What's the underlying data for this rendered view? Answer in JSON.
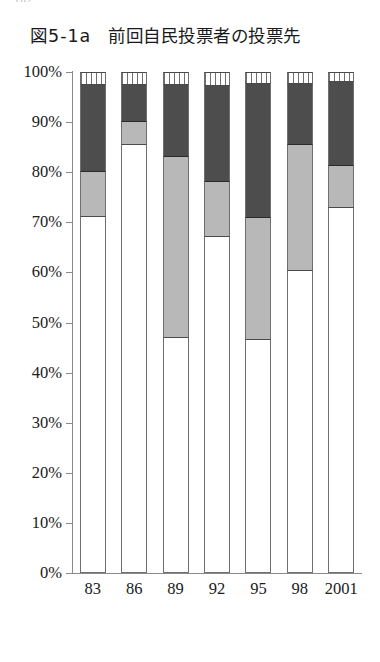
{
  "page_number": "102",
  "figure": {
    "label": "図5-1a",
    "title": "前回自民投票者の投票先"
  },
  "chart_data": {
    "type": "bar",
    "stacked": true,
    "normalized_percent": true,
    "title": "前回自民投票者の投票先",
    "xlabel": "",
    "ylabel": "",
    "ylim": [
      0,
      100
    ],
    "ytick_labels": [
      "100%",
      "90%",
      "80%",
      "70%",
      "60%",
      "50%",
      "40%",
      "30%",
      "20%",
      "10%",
      "0%"
    ],
    "ytick_values": [
      100,
      90,
      80,
      70,
      60,
      50,
      40,
      30,
      20,
      10,
      0
    ],
    "grid": false,
    "legend": "none",
    "categories": [
      "83",
      "86",
      "89",
      "92",
      "95",
      "98",
      "2001"
    ],
    "series": [
      {
        "name": "segment-white",
        "fill": "white",
        "values": [
          71.0,
          85.5,
          47.0,
          67.0,
          46.5,
          60.3,
          72.9
        ]
      },
      {
        "name": "segment-light-gray",
        "fill": "light-gray",
        "values": [
          9.0,
          4.5,
          36.0,
          11.0,
          24.4,
          25.1,
          8.3
        ]
      },
      {
        "name": "segment-dark-gray",
        "fill": "dark-gray",
        "values": [
          17.4,
          7.4,
          14.4,
          19.2,
          26.7,
          12.2,
          16.8
        ]
      },
      {
        "name": "segment-hatched",
        "fill": "vertical-hatch",
        "values": [
          2.6,
          2.6,
          2.6,
          2.8,
          2.4,
          2.4,
          2.0
        ]
      }
    ]
  },
  "colors": {
    "white": "#ffffff",
    "light_gray": "#b8b8b8",
    "dark_gray": "#4d4d4d",
    "axis": "#8a8a8a",
    "outline": "#6f6f6f",
    "text": "#202020"
  }
}
